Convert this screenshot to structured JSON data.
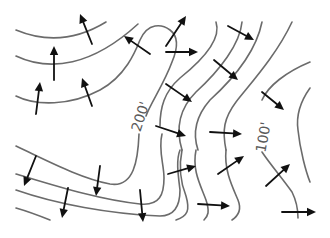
{
  "diagram": {
    "background": "#ffffff",
    "contour_color": "#6b6b6b",
    "arrow_color": "#111111",
    "labels": [
      {
        "text": "200'",
        "x": 145,
        "y": 118,
        "rotate": -72
      },
      {
        "text": "100'",
        "x": 268,
        "y": 138,
        "rotate": -80
      }
    ],
    "contours": [
      {
        "id": "c1",
        "d": "M16,30 C40,40 70,44 106,22"
      },
      {
        "id": "c2",
        "d": "M16,56 C50,72 92,66 138,24"
      },
      {
        "id": "c3",
        "d": "M16,96 C36,106 70,106 100,90 C126,76 136,50 140,40 C148,22 162,24 170,30 C178,36 178,48 172,62 C164,84 150,104 146,116"
      },
      {
        "id": "c4",
        "d": "M216,22 C222,40 200,62 180,78 C164,92 160,108 160,126"
      },
      {
        "id": "c5",
        "d": "M242,22 C240,44 220,70 196,92 C178,110 176,130 182,150"
      },
      {
        "id": "c6",
        "d": "M262,22 C256,52 232,80 210,100 C196,116 192,132 198,150"
      },
      {
        "id": "c7",
        "d": "M292,22 C276,56 250,84 236,102 C224,118 222,130 226,150"
      },
      {
        "id": "c8",
        "d": "M310,62 C286,72 268,86 262,100"
      },
      {
        "id": "c9",
        "d": "M310,88 C300,102 296,116 298,130 C300,150 306,172 310,182"
      },
      {
        "id": "c10",
        "d": "M16,146 C50,162 80,178 110,184 C134,188 138,160 139,134"
      },
      {
        "id": "c11",
        "d": "M16,174 C56,186 100,200 140,204 C160,206 164,194 164,178 C164,164 158,150 162,134"
      },
      {
        "id": "c12",
        "d": "M16,190 C56,204 110,214 160,216 C176,216 180,204 180,190 C178,174 176,160 180,150"
      },
      {
        "id": "c13",
        "d": "M16,208 C30,212 40,216 50,220"
      },
      {
        "id": "c14",
        "d": "M182,150 C178,170 182,186 186,196 C190,210 188,216 176,220"
      },
      {
        "id": "c15",
        "d": "M196,150 C192,170 200,184 206,200 C210,212 208,216 204,220"
      },
      {
        "id": "c16",
        "d": "M226,150 C224,170 232,186 238,200 C242,210 238,216 232,220"
      },
      {
        "id": "c17",
        "d": "M262,152 C270,164 282,178 292,192 C298,204 298,212 298,218"
      }
    ],
    "arrows": [
      {
        "x1": 92,
        "y1": 44,
        "x2": 80,
        "y2": 14
      },
      {
        "x1": 54,
        "y1": 80,
        "x2": 54,
        "y2": 46
      },
      {
        "x1": 36,
        "y1": 114,
        "x2": 40,
        "y2": 82
      },
      {
        "x1": 92,
        "y1": 106,
        "x2": 82,
        "y2": 78
      },
      {
        "x1": 150,
        "y1": 54,
        "x2": 124,
        "y2": 36
      },
      {
        "x1": 166,
        "y1": 46,
        "x2": 186,
        "y2": 16
      },
      {
        "x1": 166,
        "y1": 52,
        "x2": 198,
        "y2": 52
      },
      {
        "x1": 228,
        "y1": 26,
        "x2": 254,
        "y2": 40
      },
      {
        "x1": 214,
        "y1": 60,
        "x2": 238,
        "y2": 80
      },
      {
        "x1": 166,
        "y1": 84,
        "x2": 192,
        "y2": 102
      },
      {
        "x1": 262,
        "y1": 92,
        "x2": 284,
        "y2": 110
      },
      {
        "x1": 156,
        "y1": 126,
        "x2": 186,
        "y2": 136
      },
      {
        "x1": 210,
        "y1": 132,
        "x2": 242,
        "y2": 134
      },
      {
        "x1": 168,
        "y1": 174,
        "x2": 196,
        "y2": 166
      },
      {
        "x1": 218,
        "y1": 174,
        "x2": 244,
        "y2": 156
      },
      {
        "x1": 266,
        "y1": 186,
        "x2": 290,
        "y2": 164
      },
      {
        "x1": 198,
        "y1": 204,
        "x2": 230,
        "y2": 206
      },
      {
        "x1": 282,
        "y1": 212,
        "x2": 316,
        "y2": 212
      },
      {
        "x1": 36,
        "y1": 156,
        "x2": 24,
        "y2": 186
      },
      {
        "x1": 100,
        "y1": 166,
        "x2": 96,
        "y2": 196
      },
      {
        "x1": 68,
        "y1": 188,
        "x2": 62,
        "y2": 218
      },
      {
        "x1": 140,
        "y1": 190,
        "x2": 143,
        "y2": 222
      }
    ]
  }
}
